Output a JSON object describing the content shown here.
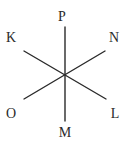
{
  "diagram": {
    "type": "star-of-lines",
    "center": [
      65,
      75
    ],
    "lines": [
      {
        "name": "P-M",
        "from": [
          65,
          27
        ],
        "to": [
          65,
          121
        ]
      },
      {
        "name": "K-L",
        "from": [
          24,
          51
        ],
        "to": [
          106,
          99
        ]
      },
      {
        "name": "N-O",
        "from": [
          105,
          51
        ],
        "to": [
          24,
          99
        ]
      }
    ],
    "labels": [
      {
        "text": "P",
        "x": 62,
        "y": 21
      },
      {
        "text": "K",
        "x": 11,
        "y": 42
      },
      {
        "text": "N",
        "x": 114,
        "y": 42
      },
      {
        "text": "O",
        "x": 11,
        "y": 118
      },
      {
        "text": "L",
        "x": 115,
        "y": 118
      },
      {
        "text": "M",
        "x": 65,
        "y": 137
      }
    ],
    "line_color": "#2a2a2a"
  }
}
